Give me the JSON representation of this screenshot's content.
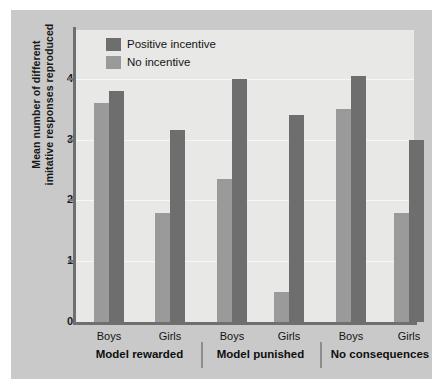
{
  "chart_data": {
    "type": "bar",
    "title": "",
    "subtitle": "",
    "xlabel": "",
    "ylabel": "Mean number of different imitative responses reproduced",
    "ylabel_lines": [
      "Mean number of different",
      "imitative responses reproduced"
    ],
    "ylim": [
      0,
      4.8
    ],
    "yticks": [
      0,
      1,
      2,
      3,
      4
    ],
    "ytick_labels": [
      "0",
      "1",
      "2",
      "3",
      "4"
    ],
    "grid": true,
    "grid_axis": "y",
    "legend_position": "top-left",
    "categories": [
      "Boys",
      "Girls",
      "Boys",
      "Girls",
      "Boys",
      "Girls"
    ],
    "groups": [
      {
        "label": "Model rewarded",
        "categories": [
          "Boys",
          "Girls"
        ]
      },
      {
        "label": "Model punished",
        "categories": [
          "Boys",
          "Girls"
        ]
      },
      {
        "label": "No consequences",
        "categories": [
          "Boys",
          "Girls"
        ]
      }
    ],
    "series": [
      {
        "name": "No incentive",
        "color": "#9a9a9a",
        "values": [
          3.6,
          1.8,
          2.35,
          0.5,
          3.5,
          1.8
        ]
      },
      {
        "name": "Positive incentive",
        "color": "#6e6e6e",
        "values": [
          3.8,
          3.15,
          4.0,
          3.4,
          4.05,
          3.0
        ]
      }
    ],
    "bars": [
      {
        "group": "Model rewarded",
        "category": "Boys",
        "series": "No incentive",
        "value": 3.6
      },
      {
        "group": "Model rewarded",
        "category": "Boys",
        "series": "Positive incentive",
        "value": 3.8
      },
      {
        "group": "Model rewarded",
        "category": "Girls",
        "series": "No incentive",
        "value": 1.8
      },
      {
        "group": "Model rewarded",
        "category": "Girls",
        "series": "Positive incentive",
        "value": 3.15
      },
      {
        "group": "Model punished",
        "category": "Boys",
        "series": "No incentive",
        "value": 2.35
      },
      {
        "group": "Model punished",
        "category": "Boys",
        "series": "Positive incentive",
        "value": 4.0
      },
      {
        "group": "Model punished",
        "category": "Girls",
        "series": "No incentive",
        "value": 0.5
      },
      {
        "group": "Model punished",
        "category": "Girls",
        "series": "Positive incentive",
        "value": 3.4
      },
      {
        "group": "No consequences",
        "category": "Boys",
        "series": "No incentive",
        "value": 3.5
      },
      {
        "group": "No consequences",
        "category": "Boys",
        "series": "Positive incentive",
        "value": 4.05
      },
      {
        "group": "No consequences",
        "category": "Girls",
        "series": "No incentive",
        "value": 1.8
      },
      {
        "group": "No consequences",
        "category": "Girls",
        "series": "Positive incentive",
        "value": 3.0
      }
    ]
  },
  "legend": {
    "items": [
      {
        "label": "Positive incentive",
        "color": "#6e6e6e"
      },
      {
        "label": "No incentive",
        "color": "#9a9a9a"
      }
    ]
  },
  "colors": {
    "figure_background": "#ffffff",
    "mat_background": "#c9c9c9",
    "panel_background": "#e8e8e6",
    "gridline": "#f7f7f5",
    "axis": "#6f6f6f",
    "text": "#141414",
    "positive_incentive": "#6e6e6e",
    "no_incentive": "#9a9a9a"
  }
}
